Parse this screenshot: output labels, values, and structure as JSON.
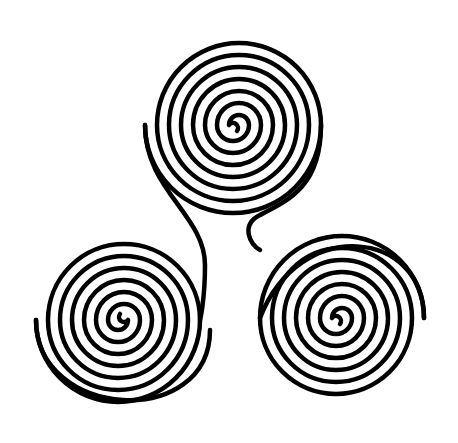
{
  "image": {
    "title": "Triskelion (triple spiral)",
    "background": "#ffffff",
    "stroke_color": "#000000"
  },
  "spirals": [
    {
      "name": "top",
      "center": [
        230,
        125
      ]
    },
    {
      "name": "left",
      "center": [
        126,
        320
      ]
    },
    {
      "name": "right",
      "center": [
        334,
        318
      ]
    }
  ]
}
